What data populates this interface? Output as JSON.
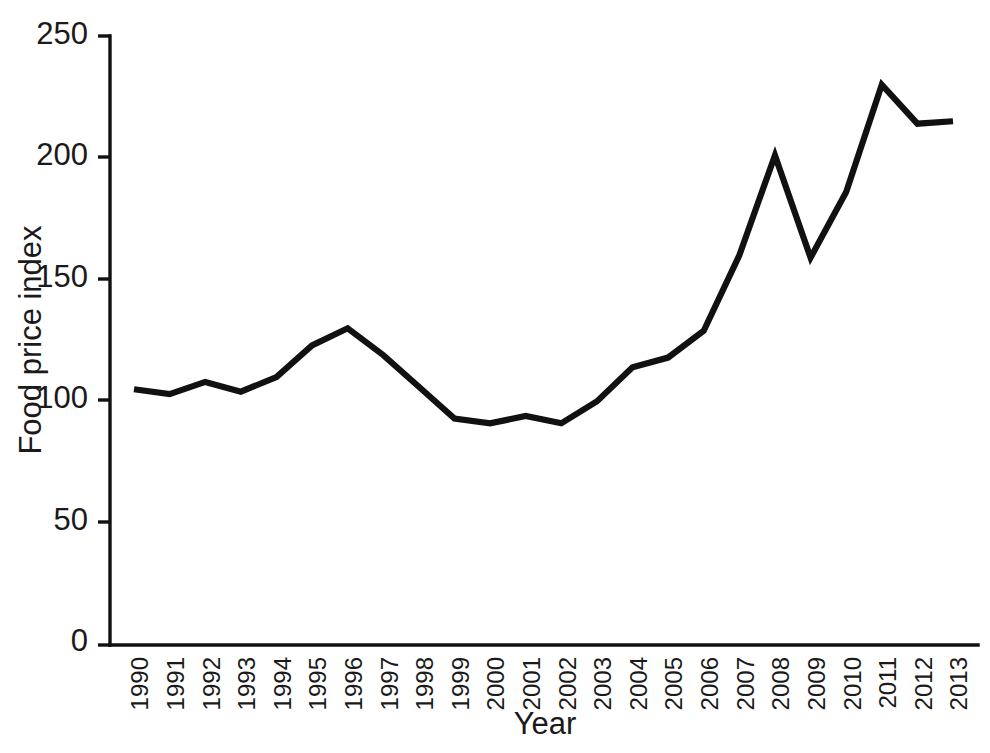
{
  "chart_data": {
    "type": "line",
    "title": "",
    "subtitle": "",
    "xlabel": "Year",
    "ylabel": "Food price index",
    "categories": [
      "1990",
      "1991",
      "1992",
      "1993",
      "1994",
      "1995",
      "1996",
      "1997",
      "1998",
      "1999",
      "2000",
      "2001",
      "2002",
      "2003",
      "2004",
      "2005",
      "2006",
      "2007",
      "2008",
      "2009",
      "2010",
      "2011",
      "2012",
      "2013"
    ],
    "x": [
      1990,
      1991,
      1992,
      1993,
      1994,
      1995,
      1996,
      1997,
      1998,
      1999,
      2000,
      2001,
      2002,
      2003,
      2004,
      2005,
      2006,
      2007,
      2008,
      2009,
      2010,
      2011,
      2012,
      2013
    ],
    "values": [
      105,
      103,
      108,
      104,
      110,
      123,
      130,
      119,
      106,
      93,
      91,
      94,
      91,
      100,
      114,
      118,
      129,
      160,
      201,
      159,
      186,
      230,
      214,
      215
    ],
    "series": [
      {
        "name": "Food price index",
        "color": "#111111",
        "values": [
          105,
          103,
          108,
          104,
          110,
          123,
          130,
          119,
          106,
          93,
          91,
          94,
          91,
          100,
          114,
          118,
          129,
          160,
          201,
          159,
          186,
          230,
          214,
          215
        ]
      }
    ],
    "xlim": [
      1990,
      2013
    ],
    "ylim": [
      0,
      250
    ],
    "yticks": [
      0,
      50,
      100,
      150,
      200,
      250
    ],
    "ytick_labels": [
      "0",
      "50",
      "100",
      "150",
      "200",
      "250"
    ],
    "xtick_labels": [
      "1990",
      "1991",
      "1992",
      "1993",
      "1994",
      "1995",
      "1996",
      "1997",
      "1998",
      "1999",
      "2000",
      "2001",
      "2002",
      "2003",
      "2004",
      "2005",
      "2006",
      "2007",
      "2008",
      "2009",
      "2010",
      "2011",
      "2012",
      "2013"
    ],
    "xtick_rotation": 90,
    "grid": false,
    "legend": false,
    "legend_position": "none",
    "line_color": "#111111",
    "background_color": "#ffffff",
    "axis_color": "#111111",
    "markers": false
  }
}
